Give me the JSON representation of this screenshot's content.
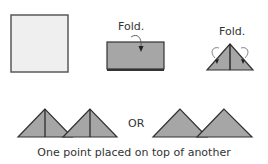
{
  "diagram": {
    "steps": [
      {
        "id": "square",
        "label": ""
      },
      {
        "id": "fold-rectangle",
        "label": "Fold."
      },
      {
        "id": "fold-triangle",
        "label": "Fold."
      }
    ],
    "separator_label": "OR",
    "caption": "One point placed on top of another",
    "colors": {
      "paper_light": "#efefef",
      "paper_gray": "#a6a6a6",
      "outline": "#333333"
    }
  }
}
